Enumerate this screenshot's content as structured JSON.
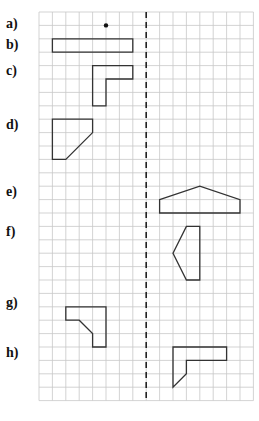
{
  "grid": {
    "origin_x": 39,
    "origin_y": 12,
    "cell": 13.4,
    "cols": 16,
    "rows": 29,
    "line_color": "#c8c8c8",
    "axis_col": 8,
    "axis_color": "#222222"
  },
  "labels": [
    {
      "text": "a)",
      "row": 1
    },
    {
      "text": "b)",
      "row": 2.5
    },
    {
      "text": "c)",
      "row": 4.5
    },
    {
      "text": "d)",
      "row": 8.5
    },
    {
      "text": "e)",
      "row": 13.5
    },
    {
      "text": "f)",
      "row": 16.5
    },
    {
      "text": "g)",
      "row": 21.8
    },
    {
      "text": "h)",
      "row": 25.5
    }
  ],
  "shapes": [
    {
      "id": "a",
      "type": "point",
      "points": [
        [
          5,
          1
        ]
      ]
    },
    {
      "id": "b",
      "type": "polygon",
      "points": [
        [
          1,
          2
        ],
        [
          7,
          2
        ],
        [
          7,
          3
        ],
        [
          1,
          3
        ]
      ]
    },
    {
      "id": "c",
      "type": "polygon",
      "points": [
        [
          4,
          4
        ],
        [
          7,
          4
        ],
        [
          7,
          5
        ],
        [
          5,
          5
        ],
        [
          5,
          7
        ],
        [
          4,
          7
        ]
      ]
    },
    {
      "id": "d",
      "type": "polygon",
      "points": [
        [
          1,
          8
        ],
        [
          4,
          8
        ],
        [
          4,
          9
        ],
        [
          2,
          11
        ],
        [
          1,
          11
        ]
      ]
    },
    {
      "id": "e",
      "type": "polygon",
      "points": [
        [
          9,
          14
        ],
        [
          12,
          13
        ],
        [
          15,
          14
        ],
        [
          15,
          15
        ],
        [
          9,
          15
        ]
      ]
    },
    {
      "id": "f",
      "type": "polygon",
      "points": [
        [
          11,
          16
        ],
        [
          12,
          16
        ],
        [
          12,
          20
        ],
        [
          11,
          20
        ],
        [
          10,
          18
        ]
      ]
    },
    {
      "id": "g",
      "type": "polygon",
      "points": [
        [
          2,
          22
        ],
        [
          5,
          22
        ],
        [
          5,
          25
        ],
        [
          4,
          25
        ],
        [
          4,
          24
        ],
        [
          3,
          23
        ],
        [
          2,
          23
        ]
      ]
    },
    {
      "id": "h",
      "type": "polygon",
      "points": [
        [
          10,
          25
        ],
        [
          14,
          25
        ],
        [
          14,
          26
        ],
        [
          11,
          26
        ],
        [
          11,
          27
        ],
        [
          10,
          28
        ]
      ]
    }
  ],
  "shape_stroke": "#333333"
}
